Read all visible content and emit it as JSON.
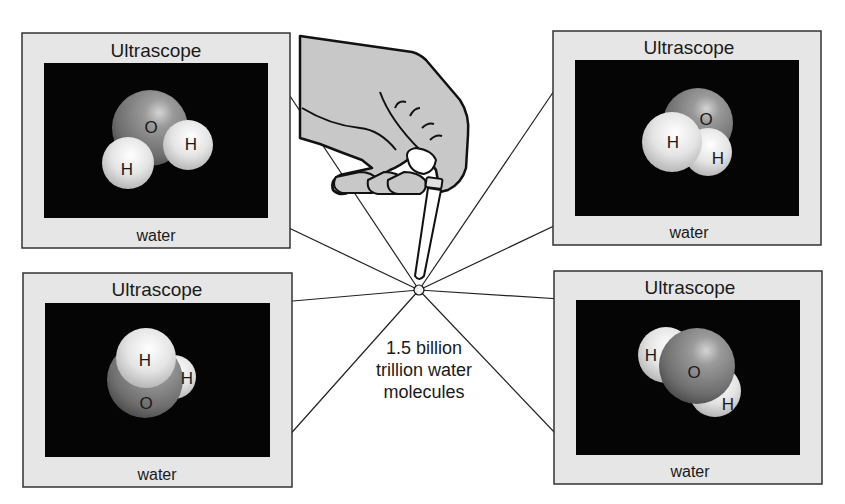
{
  "scopes": [
    {
      "position": "top-left",
      "title": "Ultrascope",
      "caption": "water",
      "atoms": {
        "O": "O",
        "H1": "H",
        "H2": "H"
      }
    },
    {
      "position": "top-right",
      "title": "Ultrascope",
      "caption": "water",
      "atoms": {
        "O": "O",
        "H1": "H",
        "H2": "H"
      }
    },
    {
      "position": "bottom-left",
      "title": "Ultrascope",
      "caption": "water",
      "atoms": {
        "O": "O",
        "H1": "H",
        "H2": "H"
      }
    },
    {
      "position": "bottom-right",
      "title": "Ultrascope",
      "caption": "water",
      "atoms": {
        "O": "O",
        "H1": "H",
        "H2": "H"
      }
    }
  ],
  "drop_caption": {
    "line1": "1.5 billion",
    "line2": "trillion water",
    "line3": "molecules"
  },
  "colors": {
    "frame_fill": "#e6e6e6",
    "frame_stroke": "#333333",
    "screen": "#050505",
    "hand_fill": "#c8c8c8",
    "oxygen": "#7a7a7a",
    "hydrogen": "#e8e8e8"
  }
}
